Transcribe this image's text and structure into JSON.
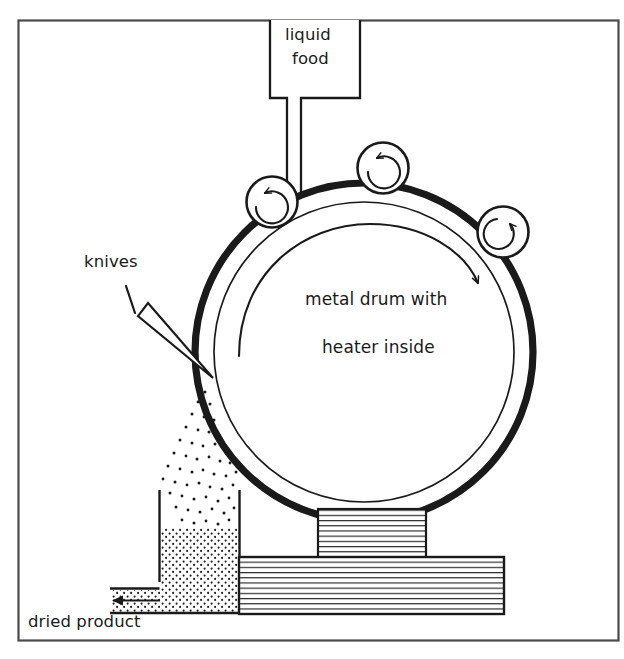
{
  "figure": {
    "kind": "process-flow-diagram",
    "background_color": "#ffffff",
    "ink_color": "#1a1a1a",
    "frame": {
      "x": 18,
      "y": 20,
      "width": 600,
      "height": 620,
      "stroke": "#4a4a4a"
    }
  },
  "labels": {
    "feed": "liquid\nfood",
    "feed_line1": "liquid",
    "feed_line2": "food",
    "knives": "knives",
    "drum_line1": "metal drum with",
    "drum_line2": "heater inside",
    "output": "dried product"
  },
  "components": {
    "feed_box": {
      "name": "liquid food hopper",
      "x": 270,
      "y": 20,
      "width": 90,
      "height": 78
    },
    "feed_pipe": {
      "name": "feed pipe",
      "x": 287,
      "y": 98,
      "width": 14,
      "height": 100
    },
    "drum": {
      "name": "metal drum with heater inside",
      "cx": 364,
      "cy": 352,
      "r_outer": 172,
      "r_inner": 152,
      "outer_stroke_width": 7,
      "inner_stroke_width": 1.6
    },
    "rotation_arrow": {
      "name": "drum rotation arrow",
      "direction": "clockwise"
    },
    "rollers": [
      {
        "name": "spreader-roller-left",
        "cx": 272,
        "cy": 202,
        "r": 26,
        "arrow": "counterclockwise"
      },
      {
        "name": "spreader-roller-middle",
        "cx": 383,
        "cy": 168,
        "r": 26,
        "arrow": "counterclockwise"
      },
      {
        "name": "spreader-roller-right",
        "cx": 503,
        "cy": 232,
        "r": 26,
        "arrow": "clockwise"
      }
    ],
    "knife": {
      "name": "scraper knife blade",
      "tip_x": 212,
      "tip_y": 379
    },
    "knife_leader": {
      "name": "knives leader tick",
      "x1": 126,
      "y1": 286,
      "x2": 134,
      "y2": 312
    },
    "particle_spray": {
      "name": "dried flakes falling",
      "count": 70
    },
    "collection_hopper": {
      "name": "product collection hopper",
      "x": 158,
      "y": 490,
      "width": 82,
      "height": 122
    },
    "hopper_fill_top_y": 528,
    "outlet_chute": {
      "name": "dried product outlet",
      "y": 582,
      "height": 22
    },
    "outlet_arrow": {
      "name": "product discharge arrow",
      "direction": "left"
    },
    "pedestal": {
      "name": "drum pedestal",
      "x": 318,
      "y": 509,
      "width": 108,
      "height": 48,
      "hatch": "horizontal"
    },
    "base_block": {
      "name": "machine base",
      "x": 238,
      "y": 557,
      "width": 266,
      "height": 58,
      "hatch": "horizontal"
    }
  }
}
